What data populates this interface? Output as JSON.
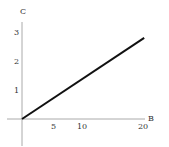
{
  "chart_data": {
    "type": "line",
    "title": "",
    "xlabel": "B",
    "ylabel": "C",
    "xlim": [
      -3,
      21
    ],
    "ylim": [
      -1,
      3.3
    ],
    "xticks": [
      5,
      10,
      20
    ],
    "yticks": [
      1,
      2,
      3
    ],
    "grid": false,
    "legend": null,
    "series": [
      {
        "name": "C vs B",
        "x": [
          0,
          20.2
        ],
        "y": [
          0,
          2.8
        ]
      }
    ]
  },
  "axes": {
    "x_label": "B",
    "y_label": "C",
    "x_tick_labels": [
      "5",
      "10",
      "20"
    ],
    "y_tick_labels": [
      "1",
      "2",
      "3"
    ]
  },
  "colors": {
    "line": "#111111",
    "axis": "#aaaaaa",
    "text": "#333333"
  }
}
